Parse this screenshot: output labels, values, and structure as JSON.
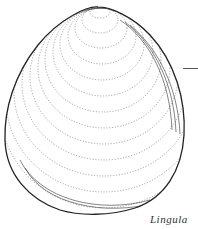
{
  "figure": {
    "caption": "Lingula",
    "colors": {
      "line": "#222222",
      "background": "#ffffff"
    }
  }
}
